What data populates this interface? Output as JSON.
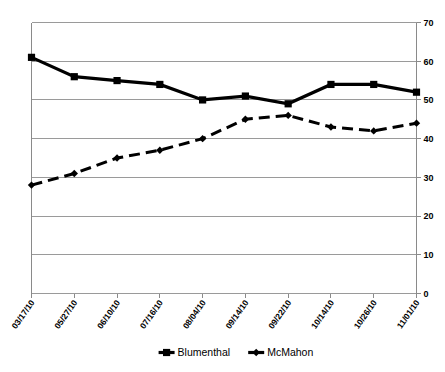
{
  "chart_data": {
    "type": "line",
    "title": "",
    "subtitle": "",
    "xlabel": "",
    "ylabel": "",
    "categories": [
      "03/17/10",
      "05/27/10",
      "06/10/10",
      "07/16/10",
      "08/04/10",
      "09/14/10",
      "09/22/10",
      "10/14/10",
      "10/26/10",
      "11/01/10"
    ],
    "series": [
      {
        "name": "Blumenthal",
        "values": [
          61,
          56,
          55,
          54,
          50,
          51,
          49,
          54,
          54,
          52
        ],
        "line_style": "solid",
        "marker": "square",
        "color": "#000000"
      },
      {
        "name": "McMahon",
        "values": [
          28,
          31,
          35,
          37,
          40,
          45,
          46,
          43,
          42,
          44
        ],
        "line_style": "dashed",
        "marker": "diamond",
        "color": "#000000"
      }
    ],
    "ylim": [
      0,
      70
    ],
    "yticks": [
      0,
      10,
      20,
      30,
      40,
      50,
      60,
      70
    ],
    "ytick_labels": [
      "0",
      "10",
      "20",
      "30",
      "40",
      "50",
      "60",
      "70"
    ],
    "y_axis_position": "right",
    "grid": true,
    "grid_axis": "y",
    "legend_position": "bottom",
    "legend_entries": [
      "Blumenthal",
      "McMahon"
    ],
    "annotations": []
  },
  "legend": {
    "items": [
      {
        "label": "Blumenthal",
        "marker": "square-marker-icon"
      },
      {
        "label": "McMahon",
        "marker": "diamond-marker-icon"
      }
    ]
  }
}
